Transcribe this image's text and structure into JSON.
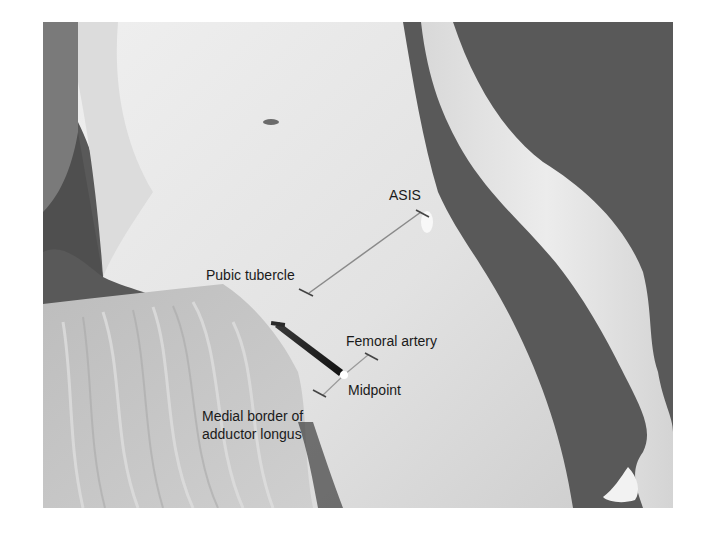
{
  "figure": {
    "background_color": "#595959",
    "skin_color": "#e6e6e6",
    "drape_color": "#c4c4c4",
    "labels": {
      "asis": "ASIS",
      "pubic_tubercle": "Pubic tubercle",
      "femoral_artery": "Femoral artery",
      "midpoint": "Midpoint",
      "medial_border_line1": "Medial border of",
      "medial_border_line2": "adductor longus"
    },
    "markers": [
      {
        "name": "asis-marker"
      },
      {
        "name": "pubic-tubercle-marker"
      },
      {
        "name": "femoral-artery-marker"
      },
      {
        "name": "medial-border-marker"
      },
      {
        "name": "midpoint-needle"
      }
    ]
  }
}
